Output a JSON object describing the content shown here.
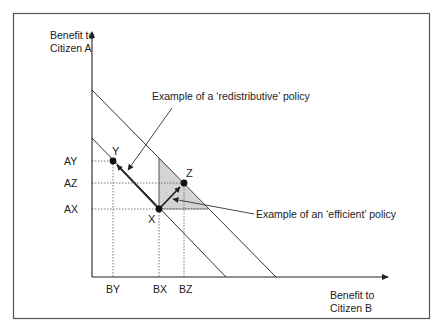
{
  "diagram": {
    "type": "policy-benefit-space",
    "y_axis_label": [
      "Benefit to",
      "Citizen A"
    ],
    "x_axis_label": [
      "Benefit to",
      "Citizen B"
    ],
    "points": [
      {
        "id": "Y",
        "label": "Y",
        "a_tick": "AY",
        "b_tick": "BY"
      },
      {
        "id": "X",
        "label": "X",
        "a_tick": "AX",
        "b_tick": "BX"
      },
      {
        "id": "Z",
        "label": "Z",
        "a_tick": "AZ",
        "b_tick": "BZ"
      }
    ],
    "y_ticks": [
      "AY",
      "AZ",
      "AX"
    ],
    "x_ticks": [
      "BY",
      "BX",
      "BZ"
    ],
    "annotations": {
      "redistributive": "Example of a ‘redistributive’ policy",
      "efficient": "Example of an ‘efficient’ policy"
    },
    "moves": [
      {
        "from": "X",
        "to": "Y",
        "kind": "redistributive"
      },
      {
        "from": "X",
        "to": "Z",
        "kind": "efficient"
      }
    ],
    "colors": {
      "line": "#222222",
      "shade": "#d4d4d4",
      "frame": "#555555"
    }
  }
}
